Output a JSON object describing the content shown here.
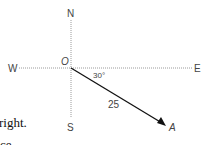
{
  "diagram": {
    "compass": {
      "north": "N",
      "south": "S",
      "east": "E",
      "west": "W"
    },
    "origin_label": "O",
    "point_label": "A",
    "angle_label": "30°",
    "length_label": "25",
    "colors": {
      "axis": "#9a9a9a",
      "vector": "#111111",
      "label": "#444444"
    }
  },
  "body_text": {
    "line1": "right.",
    "line2": "ce"
  }
}
